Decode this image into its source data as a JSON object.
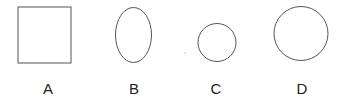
{
  "figure": {
    "shapes": [
      {
        "id": "A",
        "type": "square",
        "label": "A"
      },
      {
        "id": "B",
        "type": "ellipse",
        "label": "B"
      },
      {
        "id": "C",
        "type": "circle-small",
        "label": "C"
      },
      {
        "id": "D",
        "type": "circle-large",
        "label": "D"
      }
    ],
    "stroke_color": "#555555"
  }
}
